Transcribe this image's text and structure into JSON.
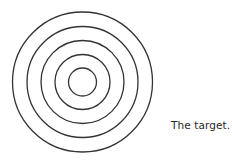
{
  "diagram": {
    "shape": "concentric-circles",
    "ring_count": 5,
    "stroke_color": "#333333",
    "caption": "The target."
  }
}
